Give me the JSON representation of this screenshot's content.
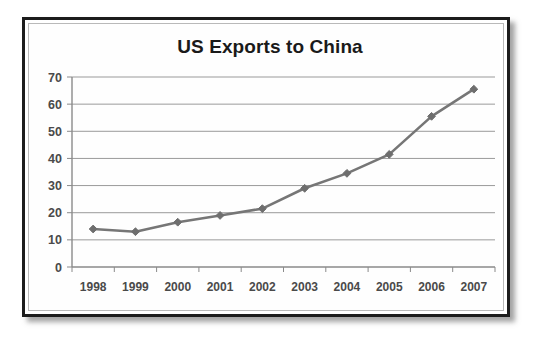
{
  "chart_data": {
    "type": "line",
    "title": "US Exports to China",
    "xlabel": "",
    "ylabel": "",
    "categories": [
      "1998",
      "1999",
      "2000",
      "2001",
      "2002",
      "2003",
      "2004",
      "2005",
      "2006",
      "2007"
    ],
    "values": [
      14,
      13,
      16.5,
      19,
      21.5,
      29,
      34.5,
      41.5,
      55.5,
      65.5
    ],
    "series": [
      {
        "name": "US Exports to China",
        "values": [
          14,
          13,
          16.5,
          19,
          21.5,
          29,
          34.5,
          41.5,
          55.5,
          65.5
        ]
      }
    ],
    "ylim": [
      0,
      70
    ],
    "yticks": [
      0,
      10,
      20,
      30,
      40,
      50,
      60,
      70
    ],
    "ytick_labels": [
      "0",
      "10",
      "20",
      "30",
      "40",
      "50",
      "60",
      "70"
    ],
    "grid": true,
    "legend": false,
    "legend_position": "none",
    "marker": "diamond",
    "line_color": "#767676",
    "marker_color": "#6e6e6e",
    "grid_color": "#9a9a9a",
    "axis_color": "#8a8a8a",
    "title_color": "#1a1a1a",
    "tick_label_color": "#4a4a4a",
    "background_color": "#ffffff",
    "frame_color": "#1c1c1c"
  }
}
